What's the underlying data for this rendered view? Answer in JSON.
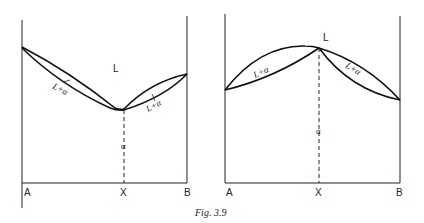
{
  "caption": "Fig. 3.9",
  "left_diagram": {
    "liquid_label": "L",
    "two_phase_left_label": "L+α",
    "two_phase_right_label": "L+α",
    "solid_label": "α",
    "axis_labels": {
      "left": "A",
      "middle": "X",
      "right": "B"
    },
    "description": "Minimum-melting (congruent minimum) phase diagram"
  },
  "right_diagram": {
    "liquid_label": "L",
    "two_phase_left_label": "L+α",
    "two_phase_right_label": "L+α",
    "solid_label": "α",
    "axis_labels": {
      "left": "A",
      "middle": "X",
      "right": "B"
    },
    "description": "Maximum-melting (congruent maximum) phase diagram"
  }
}
